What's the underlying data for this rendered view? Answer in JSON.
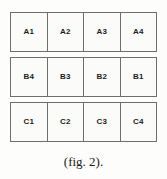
{
  "figure": {
    "caption": "(fig. 2).",
    "border_color": "#6e6e6e",
    "cell_background": "#fbfbfa",
    "text_color": "#1d1d1d",
    "rows": [
      {
        "name": "row-a",
        "cells": [
          {
            "label": "A1"
          },
          {
            "label": "A2"
          },
          {
            "label": "A3"
          },
          {
            "label": "A4"
          }
        ]
      },
      {
        "name": "row-b",
        "cells": [
          {
            "label": "B4"
          },
          {
            "label": "B3"
          },
          {
            "label": "B2"
          },
          {
            "label": "B1"
          }
        ]
      },
      {
        "name": "row-c",
        "cells": [
          {
            "label": "C1"
          },
          {
            "label": "C2"
          },
          {
            "label": "C3"
          },
          {
            "label": "C4"
          }
        ]
      }
    ]
  }
}
